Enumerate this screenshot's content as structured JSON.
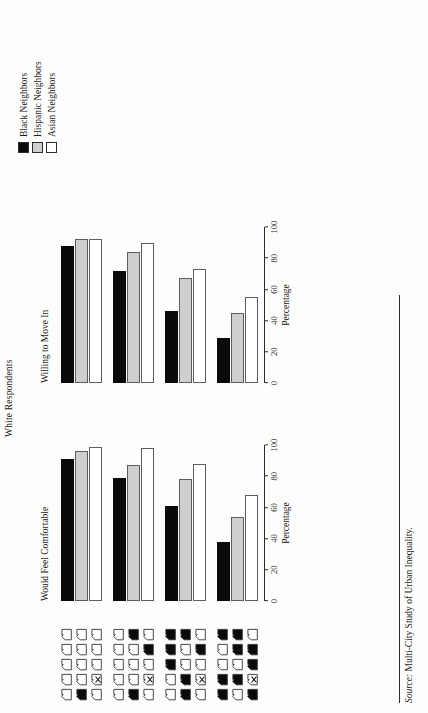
{
  "figure": {
    "title": "White Respondents",
    "source_prefix": "Source:",
    "source_text": " Multi-City Study of Urban Inequality."
  },
  "legend": {
    "items": [
      {
        "label": "Black Neighbors",
        "swatch": "black",
        "color": "#0a0a0a"
      },
      {
        "label": "Hispanic Neighbors",
        "swatch": "gray",
        "color": "#cfcfcf"
      },
      {
        "label": "Asian Neighbors",
        "swatch": "white",
        "color": "#ffffff"
      }
    ]
  },
  "axis": {
    "label": "Percentage",
    "ticks": [
      "0",
      "20",
      "40",
      "60",
      "80",
      "100"
    ],
    "min": 0,
    "max": 100
  },
  "panels": [
    {
      "key": "comfortable",
      "title": "Would Feel Comfortable"
    },
    {
      "key": "move_in",
      "title": "Willing to Move In"
    }
  ],
  "house_grids": [
    {
      "index": 0,
      "black_count": 1,
      "cells": [
        "w",
        "w",
        "w",
        "w",
        "w",
        "b",
        "w",
        "w",
        "w",
        "w",
        "w",
        "x",
        "w",
        "w",
        "w"
      ]
    },
    {
      "index": 1,
      "black_count": 3,
      "cells": [
        "w",
        "w",
        "w",
        "w",
        "w",
        "b",
        "w",
        "w",
        "w",
        "b",
        "w",
        "x",
        "w",
        "b",
        "w"
      ]
    },
    {
      "index": 2,
      "black_count": 5,
      "cells": [
        "w",
        "w",
        "b",
        "b",
        "b",
        "b",
        "b",
        "w",
        "w",
        "b",
        "w",
        "x",
        "w",
        "b",
        "w"
      ]
    },
    {
      "index": 3,
      "black_count": 7,
      "cells": [
        "b",
        "b",
        "w",
        "w",
        "b",
        "w",
        "b",
        "w",
        "b",
        "b",
        "b",
        "x",
        "b",
        "b",
        "w"
      ]
    }
  ],
  "chart_data": {
    "type": "bar",
    "title": "White Respondents",
    "xlabel": "Percentage",
    "ylabel": "",
    "xlim": [
      0,
      100
    ],
    "grid": false,
    "legend_position": "top-right",
    "categories": [
      "1 black neighbor",
      "3 black neighbors",
      "5 black neighbors",
      "7 black neighbors"
    ],
    "panels": [
      {
        "name": "Would Feel Comfortable",
        "series": [
          {
            "name": "Black Neighbors",
            "color": "#0a0a0a",
            "values": [
              91,
              79,
              61,
              38
            ]
          },
          {
            "name": "Hispanic Neighbors",
            "color": "#cfcfcf",
            "values": [
              96,
              87,
              78,
              54
            ]
          },
          {
            "name": "Asian Neighbors",
            "color": "#ffffff",
            "values": [
              99,
              98,
              88,
              68
            ]
          }
        ]
      },
      {
        "name": "Willing to Move In",
        "series": [
          {
            "name": "Black Neighbors",
            "color": "#0a0a0a",
            "values": [
              88,
              72,
              46,
              29
            ]
          },
          {
            "name": "Hispanic Neighbors",
            "color": "#cfcfcf",
            "values": [
              92,
              84,
              67,
              45
            ]
          },
          {
            "name": "Asian Neighbors",
            "color": "#ffffff",
            "values": [
              92,
              90,
              73,
              55
            ]
          }
        ]
      }
    ]
  }
}
